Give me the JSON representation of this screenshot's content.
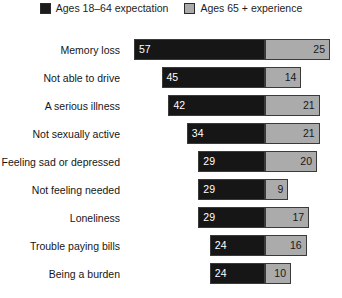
{
  "chart_data": {
    "type": "bar",
    "subtype": "diverging-horizontal-bar",
    "title": "",
    "xlabel": "",
    "ylabel": "",
    "grid": false,
    "legend_position": "top-center",
    "axis_origin_percent": 0,
    "value_unit": "percent",
    "categories": [
      "Memory loss",
      "Not able to drive",
      "A serious illness",
      "Not sexually active",
      "Feeling sad or depressed",
      "Not feeling needed",
      "Loneliness",
      "Trouble paying bills",
      "Being a burden"
    ],
    "series": [
      {
        "name": "Ages 18–64 expectation",
        "color": "#161616",
        "direction": "left",
        "values": [
          57,
          45,
          42,
          34,
          29,
          29,
          29,
          24,
          24
        ]
      },
      {
        "name": "Ages 65 + experience",
        "color": "#ababab",
        "direction": "right",
        "values": [
          25,
          14,
          21,
          21,
          20,
          9,
          17,
          16,
          10
        ]
      }
    ]
  },
  "legend": {
    "entries": [
      {
        "label": "Ages 18–64 expectation",
        "swatch": "dark"
      },
      {
        "label": "Ages 65 + experience",
        "swatch": "light"
      }
    ]
  },
  "layout": {
    "divider_x": 265,
    "px_per_unit_left": 2.3,
    "px_per_unit_right": 2.6,
    "row_height": 28,
    "bar_height": 21,
    "label_column_width": 126
  },
  "colors": {
    "expectation": "#161616",
    "experience": "#ababab",
    "bar_border": "#3a3a3a",
    "text": "#161616",
    "value_on_dark": "#ffffff",
    "value_on_light": "#191919",
    "background": "#ffffff"
  }
}
